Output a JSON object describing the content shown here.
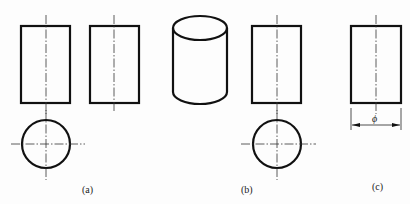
{
  "figure": {
    "labels": {
      "a": "(a)",
      "b": "(b)",
      "c": "(c)"
    },
    "dimension_symbol": "ϕ",
    "panels": [
      {
        "id": "a",
        "description": "Two-view drawing of cylinder: front view rectangle, top view circle, and side view rectangle"
      },
      {
        "id": "b",
        "description": "Isometric cylinder with front view rectangle and top view circle"
      },
      {
        "id": "c",
        "description": "Single view rectangle with diameter dimension"
      }
    ],
    "colors": {
      "line": "#111111",
      "background": "#ffffff"
    }
  }
}
